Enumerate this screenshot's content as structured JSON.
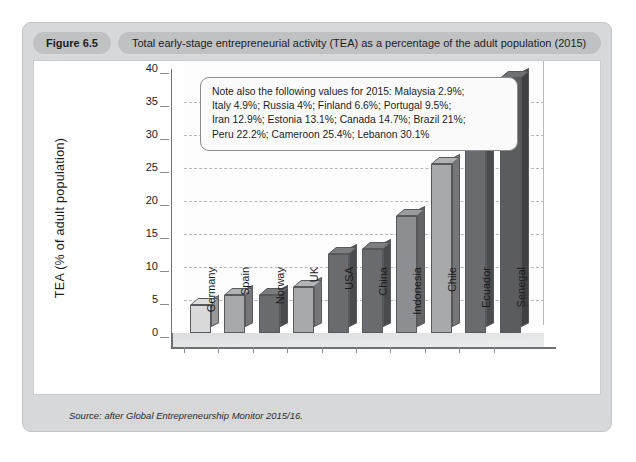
{
  "figure": {
    "badge": "Figure 6.5",
    "title": "Total early-stage entrepreneurial activity (TEA) as a percentage of the adult population (2015)",
    "source_prefix": "Source: after ",
    "source_italic": "Global Entrepreneurship Monitor 2015/16."
  },
  "note": {
    "lines": [
      "Note also the following values for 2015: Malaysia 2.9%;",
      "Italy 4.9%; Russia 4%; Finland 6.6%; Portugal 9.5%;",
      "Iran 12.9%; Estonia 13.1%; Canada 14.7%; Brazil 21%;",
      "Peru 22.2%; Cameroon 25.4%; Lebanon 30.1%"
    ]
  },
  "chart_data": {
    "type": "bar",
    "title": "Total early-stage entrepreneurial activity (TEA) as a percentage of the adult population (2015)",
    "xlabel": "",
    "ylabel": "TEA (% of adult population)",
    "ylim": [
      0,
      40
    ],
    "yticks": [
      40,
      35,
      30,
      25,
      20,
      15,
      10,
      5,
      0
    ],
    "grid": true,
    "legend": "none",
    "categories": [
      "Germany",
      "Spain",
      "Norway",
      "UK",
      "USA",
      "China",
      "Indonesia",
      "Chile",
      "Ecuador",
      "Senegal"
    ],
    "values": [
      4.3,
      5.7,
      5.7,
      6.9,
      11.9,
      12.8,
      17.7,
      25.6,
      33.6,
      38.7
    ],
    "bar_colors": [
      "#d9d9d9",
      "#a8a9ab",
      "#6a6b6e",
      "#a8a9ab",
      "#6a6b6e",
      "#6a6b6e",
      "#8d8e91",
      "#a8a9ab",
      "#6a6b6e",
      "#5b5c5f"
    ],
    "note_values": {
      "Malaysia": 2.9,
      "Italy": 4.9,
      "Russia": 4,
      "Finland": 6.6,
      "Portugal": 9.5,
      "Iran": 12.9,
      "Estonia": 13.1,
      "Canada": 14.7,
      "Brazil": 21,
      "Peru": 22.2,
      "Cameroon": 25.4,
      "Lebanon": 30.1
    }
  },
  "colors": {
    "card_bg": "#d7d8da",
    "badge_bg": "#c0c1c3",
    "plot_bg": "#ffffff",
    "axis": "#6f7073",
    "grid": "#b6b7ba"
  }
}
